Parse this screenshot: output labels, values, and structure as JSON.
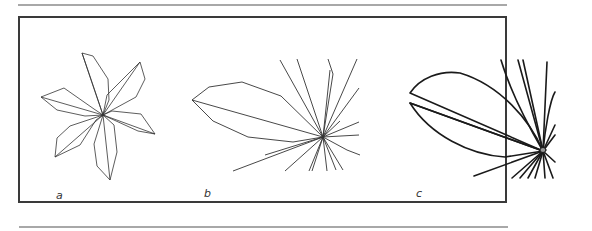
{
  "figure": {
    "panels": [
      {
        "id": "a",
        "label": "a",
        "description": "Six-petal star polygon outline with midribs meeting at a center point"
      },
      {
        "id": "b",
        "label": "b",
        "description": "Single leaf-shaped polygon with radiating thin lines from a central hub (thin strokes)"
      },
      {
        "id": "c",
        "label": "c",
        "description": "Smooth curved leaf outline with thick radiating lines from a central hub (bold strokes)"
      }
    ],
    "colors": {
      "stroke": "#222222",
      "frame": "#3a3a3a",
      "rule": "#a8a8a8",
      "background": "#ffffff"
    }
  }
}
